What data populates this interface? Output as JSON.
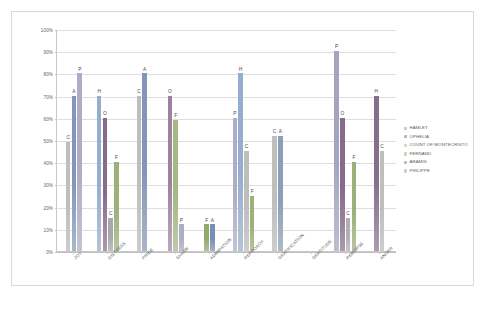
{
  "chart_data": {
    "type": "bar",
    "title": "",
    "xlabel": "",
    "ylabel": "",
    "ylim": [
      0,
      100
    ],
    "grid": true,
    "legend_position": "right",
    "ytick_labels": [
      "100%",
      "90%",
      "80%",
      "70%",
      "60%",
      "50%",
      "40%",
      "30%",
      "20%",
      "10%",
      "0%"
    ],
    "ytick_values": [
      100,
      90,
      80,
      70,
      60,
      50,
      40,
      30,
      20,
      10,
      0
    ],
    "categories": [
      "JOY",
      "DISTRESS",
      "PRIDE",
      "SHAME",
      "ADMIRATION",
      "REPROACH",
      "GRATIFICATION",
      "GRATITUDE",
      "REMORSE",
      "ANGER"
    ],
    "series": [
      {
        "name": "HAMLET",
        "initial": "H",
        "color": "#b9cde5",
        "values": [
          0,
          70,
          0,
          0,
          0,
          80,
          0,
          0,
          0,
          70
        ]
      },
      {
        "name": "OPHELIA",
        "initial": "O",
        "color": "#c6b0c8",
        "values": [
          0,
          60,
          0,
          70,
          0,
          0,
          0,
          0,
          60,
          0
        ]
      },
      {
        "name": "COUNT OF MONTECRISTO",
        "initial": "C",
        "color": "#d6d6d6",
        "values": [
          49,
          15,
          70,
          0,
          0,
          45,
          52,
          0,
          15,
          45
        ]
      },
      {
        "name": "FERNAND",
        "initial": "F",
        "color": "#cdd9b5",
        "values": [
          0,
          40,
          0,
          59,
          12,
          25,
          0,
          0,
          40,
          0
        ]
      },
      {
        "name": "ARAMIS",
        "initial": "A",
        "color": "#aebfd4",
        "values": [
          70,
          0,
          80,
          0,
          12,
          0,
          52,
          0,
          0,
          0
        ]
      },
      {
        "name": "PHILIPPE",
        "initial": "P",
        "color": "#cfcfe0",
        "values": [
          80,
          0,
          0,
          12,
          60,
          0,
          0,
          0,
          90,
          0
        ]
      }
    ],
    "bars": [
      {
        "category": "JOY",
        "entries": [
          {
            "series": "COUNT OF MONTECRISTO",
            "initial": "C",
            "value": 49,
            "color": "#dcdcdc"
          },
          {
            "series": "ARAMIS",
            "initial": "A",
            "value": 70,
            "color": "#b6c4d8"
          },
          {
            "series": "PHILIPPE",
            "initial": "P",
            "value": 80,
            "color": "#d2d2e2"
          }
        ]
      },
      {
        "category": "DISTRESS",
        "entries": [
          {
            "series": "HAMLET",
            "initial": "H",
            "value": 70,
            "color": "#c3d2e6"
          },
          {
            "series": "OPHELIA",
            "initial": "O",
            "value": 60,
            "color": "#b9a5bd"
          },
          {
            "series": "COUNT OF MONTECRISTO",
            "initial": "C",
            "value": 15,
            "color": "#cfcfcf"
          },
          {
            "series": "FERNAND",
            "initial": "F",
            "value": 40,
            "color": "#c8d4b0"
          }
        ]
      },
      {
        "category": "PRIDE",
        "entries": [
          {
            "series": "COUNT OF MONTECRISTO",
            "initial": "C",
            "value": 70,
            "color": "#dcdcdc"
          },
          {
            "series": "ARAMIS",
            "initial": "A",
            "value": 80,
            "color": "#b6c4d8"
          }
        ]
      },
      {
        "category": "SHAME",
        "entries": [
          {
            "series": "OPHELIA",
            "initial": "O",
            "value": 70,
            "color": "#c8b5cb"
          },
          {
            "series": "FERNAND",
            "initial": "F",
            "value": 59,
            "color": "#cdd9b5"
          },
          {
            "series": "PHILIPPE",
            "initial": "P",
            "value": 12,
            "color": "#d2d2e2"
          }
        ]
      },
      {
        "category": "ADMIRATION",
        "entries": [
          {
            "series": "FERNAND",
            "initial": "F",
            "value": 12,
            "color": "#c2cfa8"
          },
          {
            "series": "ARAMIS",
            "initial": "A",
            "value": 12,
            "color": "#aebfd4"
          }
        ]
      },
      {
        "category": "REPROACH",
        "entries": [
          {
            "series": "PHILIPPE",
            "initial": "P",
            "value": 60,
            "color": "#d2d2e2"
          },
          {
            "series": "HAMLET",
            "initial": "H",
            "value": 80,
            "color": "#c3d2e6"
          },
          {
            "series": "COUNT OF MONTECRISTO",
            "initial": "C",
            "value": 45,
            "color": "#dcdcdc"
          },
          {
            "series": "FERNAND",
            "initial": "F",
            "value": 25,
            "color": "#c8d4b0"
          }
        ]
      },
      {
        "category": "GRATIFICATION",
        "entries": [
          {
            "series": "COUNT OF MONTECRISTO",
            "initial": "C",
            "value": 52,
            "color": "#dcdcdc"
          },
          {
            "series": "ARAMIS",
            "initial": "A",
            "value": 52,
            "color": "#bcc9da"
          }
        ]
      },
      {
        "category": "GRATITUDE",
        "entries": []
      },
      {
        "category": "REMORSE",
        "entries": [
          {
            "series": "PHILIPPE",
            "initial": "P",
            "value": 90,
            "color": "#cdcdde"
          },
          {
            "series": "OPHELIA",
            "initial": "O",
            "value": 60,
            "color": "#b9a5bd"
          },
          {
            "series": "COUNT OF MONTECRISTO",
            "initial": "C",
            "value": 15,
            "color": "#d4d4d4"
          },
          {
            "series": "FERNAND",
            "initial": "F",
            "value": 40,
            "color": "#c8d4b0"
          }
        ]
      },
      {
        "category": "ANGER",
        "entries": [
          {
            "series": "HAMLET",
            "initial": "H",
            "value": 70,
            "color": "#b8a8bd"
          },
          {
            "series": "COUNT OF MONTECRISTO",
            "initial": "C",
            "value": 45,
            "color": "#dcdcdc"
          }
        ]
      }
    ]
  },
  "legend": {
    "items": [
      {
        "label": "HAMLET",
        "color": "#b9cde5"
      },
      {
        "label": "OPHELIA",
        "color": "#c6b0c8"
      },
      {
        "label": "COUNT OF MONTECRISTO",
        "color": "#d6d6d6"
      },
      {
        "label": "FERNAND",
        "color": "#cdd9b5"
      },
      {
        "label": "ARAMIS",
        "color": "#aebfd4"
      },
      {
        "label": "PHILIPPE",
        "color": "#cfcfe0"
      }
    ]
  }
}
